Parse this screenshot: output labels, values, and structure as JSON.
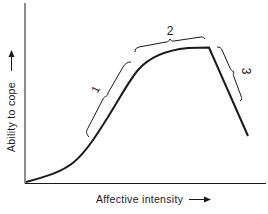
{
  "diagram": {
    "type": "curve",
    "x_axis_label": "Affective intensity",
    "y_axis_label": "Ability to cope",
    "arrow_glyph": "arrow-right",
    "segments": [
      {
        "label": "1",
        "description": "rising segment"
      },
      {
        "label": "2",
        "description": "plateau segment"
      },
      {
        "label": "3",
        "description": "falling segment"
      }
    ],
    "colors": {
      "line": "#1a1a1a",
      "background": "#ffffff"
    }
  }
}
